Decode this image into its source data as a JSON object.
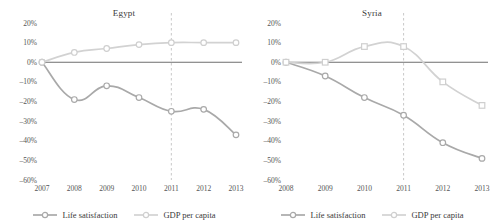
{
  "chart_data": [
    {
      "type": "line",
      "title": "Egypt",
      "xlabel": "",
      "ylabel": "",
      "x": [
        "2007",
        "2008",
        "2009",
        "2010",
        "2011",
        "2012",
        "2013"
      ],
      "categories": [
        "2007",
        "2008",
        "2009",
        "2010",
        "2011",
        "2012",
        "2013"
      ],
      "ylim": [
        -60,
        20
      ],
      "yticks": [
        "20%",
        "10%",
        "0%",
        "-10%",
        "-20%",
        "-30%",
        "-40%",
        "-50%",
        "-60%"
      ],
      "ytick_values": [
        20,
        10,
        0,
        -10,
        -20,
        -30,
        -40,
        -50,
        -60
      ],
      "grid": false,
      "legend_position": "bottom",
      "reference_line": {
        "x": "2011",
        "style": "dashed"
      },
      "series": [
        {
          "name": "Life satisfaction",
          "color": "#a9a9a9",
          "marker": "circle",
          "values": [
            0,
            -19,
            -12,
            -18,
            -25,
            -24,
            -37
          ]
        },
        {
          "name": "GDP per capita",
          "color": "#d2d2d2",
          "marker": "circle",
          "values": [
            0,
            5,
            7,
            9,
            10,
            10,
            10
          ]
        }
      ]
    },
    {
      "type": "line",
      "title": "Syria",
      "xlabel": "",
      "ylabel": "",
      "x": [
        "2008",
        "2009",
        "2010",
        "2011",
        "2012",
        "2013"
      ],
      "categories": [
        "2008",
        "2009",
        "2010",
        "2011",
        "2012",
        "2013"
      ],
      "ylim": [
        -60,
        20
      ],
      "yticks": [
        "20%",
        "10%",
        "0%",
        "-10%",
        "-20%",
        "-30%",
        "-40%",
        "-50%",
        "-60%"
      ],
      "ytick_values": [
        20,
        10,
        0,
        -10,
        -20,
        -30,
        -40,
        -50,
        -60
      ],
      "grid": false,
      "legend_position": "bottom",
      "reference_line": {
        "x": "2011",
        "style": "dashed"
      },
      "series": [
        {
          "name": "Life satisfaction",
          "color": "#a9a9a9",
          "marker": "circle",
          "values": [
            0,
            -7,
            -18,
            -27,
            -41,
            -49
          ]
        },
        {
          "name": "GDP per capita",
          "color": "#d2d2d2",
          "marker": "square",
          "values": [
            0,
            0,
            8,
            8,
            -10,
            -22
          ]
        }
      ]
    }
  ]
}
